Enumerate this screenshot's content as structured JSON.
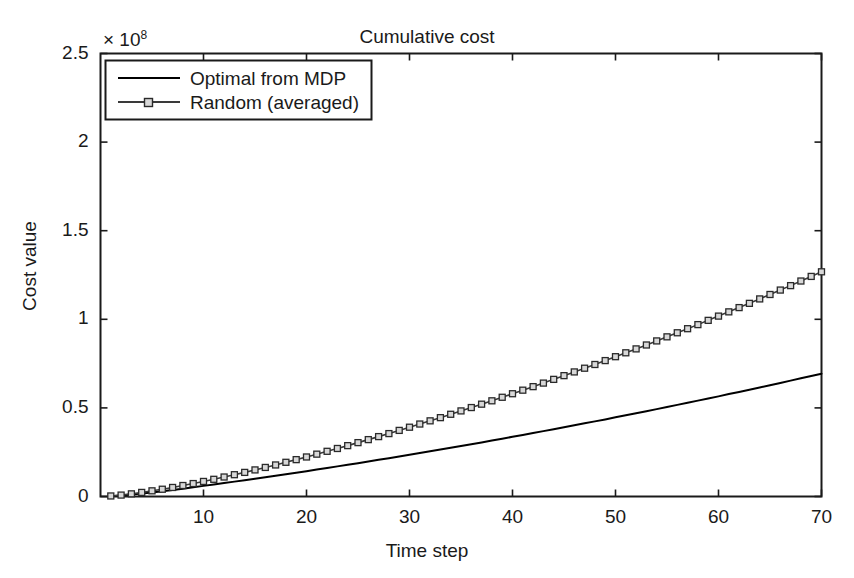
{
  "chart_data": {
    "type": "line",
    "title": "Cumulative cost",
    "xlabel": "Time step",
    "ylabel": "Cost value",
    "y_exponent_prefix": "× 10",
    "y_exponent_power": "8",
    "y_scale": 100000000,
    "xlim": [
      0,
      70
    ],
    "ylim": [
      0,
      250000000
    ],
    "grid": false,
    "legend_position": "top-left",
    "xticks": [
      10,
      20,
      30,
      40,
      50,
      60,
      70
    ],
    "xtick_labels": [
      "10",
      "20",
      "30",
      "40",
      "50",
      "60",
      "70"
    ],
    "yticks": [
      0,
      0.5,
      1,
      1.5,
      2,
      2.5
    ],
    "ytick_labels": [
      "0",
      "0.5",
      "1",
      "1.5",
      "2",
      "2.5"
    ],
    "series": [
      {
        "name": "Optimal from MDP",
        "color": "#000000",
        "marker": "none",
        "line_width": 2.0,
        "x": [
          1,
          2,
          3,
          4,
          5,
          6,
          7,
          8,
          9,
          10,
          11,
          12,
          13,
          14,
          15,
          16,
          17,
          18,
          19,
          20,
          21,
          22,
          23,
          24,
          25,
          26,
          27,
          28,
          29,
          30,
          31,
          32,
          33,
          34,
          35,
          36,
          37,
          38,
          39,
          40,
          41,
          42,
          43,
          44,
          45,
          46,
          47,
          48,
          49,
          50,
          51,
          52,
          53,
          54,
          55,
          56,
          57,
          58,
          59,
          60,
          61,
          62,
          63,
          64,
          65,
          66,
          67,
          68,
          69,
          70
        ],
        "values": [
          0.02,
          0.06,
          0.11,
          0.17,
          0.23,
          0.3,
          0.37,
          0.44,
          0.52,
          0.6,
          0.68,
          0.76,
          0.84,
          0.92,
          1.0,
          1.09,
          1.17,
          1.26,
          1.34,
          1.43,
          1.52,
          1.61,
          1.7,
          1.79,
          1.88,
          1.97,
          2.07,
          2.16,
          2.26,
          2.35,
          2.45,
          2.55,
          2.65,
          2.75,
          2.85,
          2.95,
          3.05,
          3.16,
          3.26,
          3.37,
          3.47,
          3.58,
          3.69,
          3.8,
          3.91,
          4.02,
          4.13,
          4.24,
          4.35,
          4.47,
          4.58,
          4.7,
          4.81,
          4.93,
          5.05,
          5.17,
          5.29,
          5.41,
          5.53,
          5.65,
          5.78,
          5.9,
          6.03,
          6.15,
          6.28,
          6.41,
          6.54,
          6.67,
          6.8,
          6.93
        ],
        "values_note": "values are in units of 1e7 cost; multiply by 1e7",
        "unit_multiplier": 10000000
      },
      {
        "name": "Random (averaged)",
        "color": "#3a3a3a",
        "marker": "square",
        "marker_size": 6,
        "line_width": 1.6,
        "x": [
          1,
          2,
          3,
          4,
          5,
          6,
          7,
          8,
          9,
          10,
          11,
          12,
          13,
          14,
          15,
          16,
          17,
          18,
          19,
          20,
          21,
          22,
          23,
          24,
          25,
          26,
          27,
          28,
          29,
          30,
          31,
          32,
          33,
          34,
          35,
          36,
          37,
          38,
          39,
          40,
          41,
          42,
          43,
          44,
          45,
          46,
          47,
          48,
          49,
          50,
          51,
          52,
          53,
          54,
          55,
          56,
          57,
          58,
          59,
          60,
          61,
          62,
          63,
          64,
          65,
          66,
          67,
          68,
          69,
          70
        ],
        "values": [
          0.03,
          0.08,
          0.15,
          0.23,
          0.32,
          0.41,
          0.51,
          0.62,
          0.73,
          0.85,
          0.97,
          1.1,
          1.23,
          1.36,
          1.5,
          1.64,
          1.78,
          1.93,
          2.08,
          2.23,
          2.39,
          2.55,
          2.71,
          2.87,
          3.04,
          3.21,
          3.38,
          3.55,
          3.73,
          3.91,
          4.09,
          4.27,
          4.45,
          4.64,
          4.83,
          5.02,
          5.21,
          5.4,
          5.6,
          5.8,
          6.0,
          6.2,
          6.4,
          6.61,
          6.82,
          7.03,
          7.24,
          7.45,
          7.67,
          7.89,
          8.11,
          8.33,
          8.55,
          8.78,
          9.01,
          9.24,
          9.47,
          9.7,
          9.94,
          10.18,
          10.42,
          10.66,
          10.9,
          11.15,
          11.4,
          11.65,
          11.9,
          12.16,
          12.42,
          12.68
        ],
        "values_note": "values are in units of 1e7 cost; multiply by 1e7",
        "unit_multiplier": 10000000
      }
    ]
  },
  "legend": {
    "entries": [
      {
        "label": "Optimal from MDP"
      },
      {
        "label": "Random (averaged)"
      }
    ]
  },
  "colors": {
    "axis": "#1a1a1a",
    "background": "#ffffff",
    "optimal_line": "#000000",
    "random_line": "#3a3a3a",
    "marker_fill": "#d8d8d8"
  }
}
